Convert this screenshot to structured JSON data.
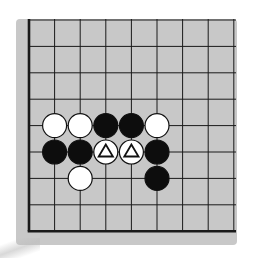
{
  "diagram": {
    "type": "go-board-corner",
    "board_color": "#c8c8c8",
    "line_color": "#1a1a1a",
    "columns": 9,
    "rows": 9,
    "edges": {
      "left": true,
      "bottom": true,
      "top": false,
      "right": false
    },
    "stones": [
      {
        "row": 4,
        "col": 1,
        "color": "white",
        "mark": ""
      },
      {
        "row": 4,
        "col": 2,
        "color": "white",
        "mark": ""
      },
      {
        "row": 4,
        "col": 3,
        "color": "black",
        "mark": ""
      },
      {
        "row": 4,
        "col": 4,
        "color": "black",
        "mark": ""
      },
      {
        "row": 4,
        "col": 5,
        "color": "white",
        "mark": ""
      },
      {
        "row": 5,
        "col": 1,
        "color": "black",
        "mark": ""
      },
      {
        "row": 5,
        "col": 2,
        "color": "black",
        "mark": ""
      },
      {
        "row": 5,
        "col": 3,
        "color": "white",
        "mark": "triangle"
      },
      {
        "row": 5,
        "col": 4,
        "color": "white",
        "mark": "triangle"
      },
      {
        "row": 5,
        "col": 5,
        "color": "black",
        "mark": ""
      },
      {
        "row": 6,
        "col": 2,
        "color": "white",
        "mark": ""
      },
      {
        "row": 6,
        "col": 5,
        "color": "black",
        "mark": ""
      }
    ]
  }
}
